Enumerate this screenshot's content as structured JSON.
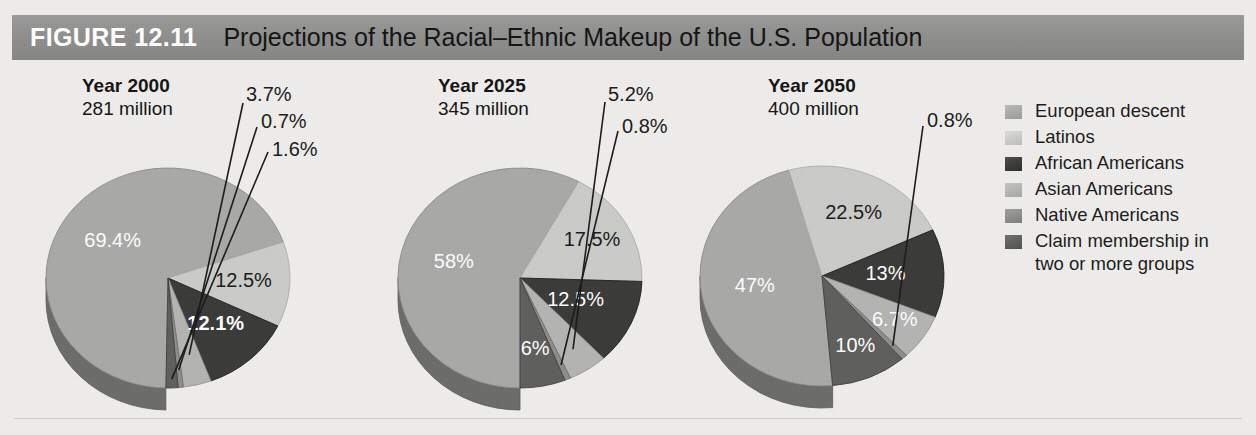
{
  "header": {
    "figure_number": "FIGURE 12.11",
    "title": "Projections of the Racial–Ethnic Makeup of the U.S. Population",
    "bar_color": "#8f8f8d",
    "number_color": "#ffffff",
    "title_color": "#121212"
  },
  "background_color": "#efeeec",
  "legend": {
    "items": [
      {
        "label": "European descent",
        "color": "#a9a9a7"
      },
      {
        "label": "Latinos",
        "color": "#cbcbc9"
      },
      {
        "label": "African Americans",
        "color": "#3a3a38"
      },
      {
        "label": "Asian Americans",
        "color": "#b4b4b2"
      },
      {
        "label": "Native Americans",
        "color": "#8d8d8b"
      },
      {
        "label": "Claim membership in\ntwo or more groups",
        "color": "#5e5e5c"
      }
    ]
  },
  "chart_data": [
    {
      "type": "pie",
      "title": "Year 2000",
      "subtitle": "281 million",
      "categories": [
        "European descent",
        "Latinos",
        "African Americans",
        "Asian Americans",
        "Native Americans",
        "Claim membership in two or more groups"
      ],
      "values": [
        69.4,
        12.5,
        12.1,
        3.7,
        0.7,
        1.6
      ],
      "labels": [
        "69.4%",
        "12.5%",
        "12.1%",
        "3.7%",
        "0.7%",
        "1.6%"
      ],
      "colors": [
        "#a9a9a7",
        "#cbcbc9",
        "#3a3a38",
        "#b4b4b2",
        "#8d8d8b",
        "#5e5e5c"
      ],
      "label_placement": [
        "inside-light",
        "inside-dark",
        "inside-light-bold",
        "outside",
        "outside",
        "outside"
      ],
      "ylabel": "",
      "xlabel": ""
    },
    {
      "type": "pie",
      "title": "Year 2025",
      "subtitle": "345 million",
      "categories": [
        "European descent",
        "Latinos",
        "African Americans",
        "Asian Americans",
        "Native Americans",
        "Claim membership in two or more groups"
      ],
      "values": [
        58,
        17.5,
        12.5,
        5.2,
        0.8,
        6
      ],
      "labels": [
        "58%",
        "17.5%",
        "12.5%",
        "5.2%",
        "0.8%",
        "6%"
      ],
      "colors": [
        "#a9a9a7",
        "#cbcbc9",
        "#3a3a38",
        "#b4b4b2",
        "#8d8d8b",
        "#5e5e5c"
      ],
      "label_placement": [
        "inside-light",
        "inside-dark",
        "inside-light",
        "outside",
        "outside",
        "inside-light"
      ],
      "ylabel": "",
      "xlabel": ""
    },
    {
      "type": "pie",
      "title": "Year 2050",
      "subtitle": "400 million",
      "categories": [
        "European descent",
        "Latinos",
        "African Americans",
        "Asian Americans",
        "Native Americans",
        "Claim membership in two or more groups"
      ],
      "values": [
        47,
        22.5,
        13,
        6.7,
        0.8,
        10
      ],
      "labels": [
        "47%",
        "22.5%",
        "13%",
        "6.7%",
        "0.8%",
        "10%"
      ],
      "colors": [
        "#a9a9a7",
        "#cbcbc9",
        "#3a3a38",
        "#b4b4b2",
        "#8d8d8b",
        "#5e5e5c"
      ],
      "label_placement": [
        "inside-light",
        "inside-dark",
        "inside-light",
        "inside-light",
        "outside",
        "inside-light"
      ],
      "ylabel": "",
      "xlabel": ""
    }
  ]
}
